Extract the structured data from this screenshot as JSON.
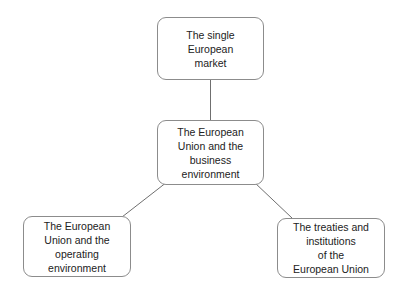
{
  "diagram": {
    "type": "tree",
    "background_color": "#ffffff",
    "node_border_color": "#8c8c8c",
    "connector_color": "#6f6f6f",
    "text_color": "#222222",
    "nodes": [
      {
        "id": "single-market",
        "label": "The single\nEuropean\nmarket",
        "level": "root"
      },
      {
        "id": "eu-business-environment",
        "label": "The European\nUnion and the\nbusiness\nenvironment",
        "level": "middle"
      },
      {
        "id": "eu-operating-environment",
        "label": "The European\nUnion and the\noperating\nenvironment",
        "level": "leaf"
      },
      {
        "id": "treaties-institutions",
        "label": "The treaties and\ninstitutions\nof the\nEuropean Union",
        "level": "leaf"
      }
    ],
    "connectors": [
      {
        "id": "single-market-to-eu-business",
        "from": "single-market",
        "to": "eu-business-environment",
        "shape": "vertical"
      },
      {
        "id": "eu-business-to-operating",
        "from": "eu-business-environment",
        "to": "eu-operating-environment",
        "shape": "diagonal"
      },
      {
        "id": "eu-business-to-treaties",
        "from": "eu-business-environment",
        "to": "treaties-institutions",
        "shape": "diagonal"
      }
    ]
  }
}
